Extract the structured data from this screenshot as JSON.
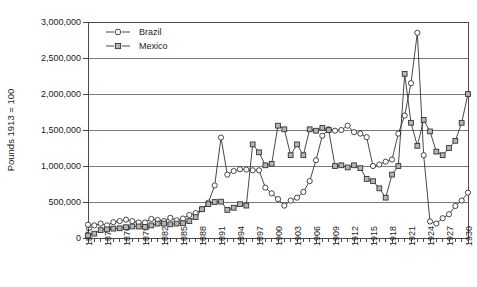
{
  "chart_data": {
    "type": "line",
    "title": "",
    "xlabel": "",
    "ylabel": "Pounds 1913 = 100",
    "xlim": [
      1870,
      1930
    ],
    "ylim": [
      0,
      3000000
    ],
    "ytick_labels": [
      "0",
      "500,000",
      "1,000,000",
      "1,500,000",
      "2,000,000",
      "2,500,000",
      "3,000,000"
    ],
    "ytick_values": [
      0,
      500000,
      1000000,
      1500000,
      2000000,
      2500000,
      3000000
    ],
    "xtick_labels": [
      "1870",
      "1873",
      "1876",
      "1879",
      "1882",
      "1885",
      "1888",
      "1891",
      "1894",
      "1897",
      "1900",
      "1903",
      "1906",
      "1909",
      "1912",
      "1915",
      "1918",
      "1921",
      "1924",
      "1927",
      "1930"
    ],
    "xtick_values": [
      1870,
      1873,
      1876,
      1879,
      1882,
      1885,
      1888,
      1891,
      1894,
      1897,
      1900,
      1903,
      1906,
      1909,
      1912,
      1915,
      1918,
      1921,
      1924,
      1927,
      1930
    ],
    "grid": true,
    "legend_position": "top-left",
    "x": [
      1870,
      1871,
      1872,
      1873,
      1874,
      1875,
      1876,
      1877,
      1878,
      1879,
      1880,
      1881,
      1882,
      1883,
      1884,
      1885,
      1886,
      1887,
      1888,
      1889,
      1890,
      1891,
      1892,
      1893,
      1894,
      1895,
      1896,
      1897,
      1898,
      1899,
      1900,
      1901,
      1902,
      1903,
      1904,
      1905,
      1906,
      1907,
      1908,
      1909,
      1910,
      1911,
      1912,
      1913,
      1914,
      1915,
      1916,
      1917,
      1918,
      1919,
      1920,
      1921,
      1922,
      1923,
      1924,
      1925,
      1926,
      1927,
      1928,
      1929,
      1930
    ],
    "series": [
      {
        "name": "Brazil",
        "marker": "circle",
        "values": [
          185000,
          175000,
          200000,
          175000,
          220000,
          235000,
          255000,
          235000,
          215000,
          215000,
          265000,
          250000,
          235000,
          280000,
          245000,
          270000,
          320000,
          345000,
          400000,
          490000,
          730000,
          1395000,
          880000,
          930000,
          955000,
          950000,
          940000,
          940000,
          700000,
          620000,
          540000,
          450000,
          520000,
          560000,
          640000,
          790000,
          1080000,
          1420000,
          1510000,
          1490000,
          1500000,
          1560000,
          1470000,
          1450000,
          1400000,
          1000000,
          1020000,
          1060000,
          1090000,
          1450000,
          1700000,
          2150000,
          2850000,
          1150000,
          230000,
          200000,
          275000,
          330000,
          445000,
          520000,
          630000
        ]
      },
      {
        "name": "Mexico",
        "marker": "square",
        "values": [
          35000,
          60000,
          110000,
          120000,
          130000,
          135000,
          150000,
          160000,
          160000,
          155000,
          175000,
          200000,
          200000,
          190000,
          200000,
          205000,
          235000,
          290000,
          400000,
          470000,
          500000,
          505000,
          390000,
          420000,
          470000,
          450000,
          1300000,
          1190000,
          1010000,
          1030000,
          1560000,
          1510000,
          1150000,
          1300000,
          1150000,
          1510000,
          1490000,
          1530000,
          1500000,
          1000000,
          1010000,
          980000,
          1010000,
          970000,
          820000,
          790000,
          690000,
          560000,
          880000,
          1000000,
          2280000,
          1600000,
          1280000,
          1640000,
          1480000,
          1200000,
          1150000,
          1250000,
          1350000,
          1600000,
          2000000
        ]
      }
    ]
  },
  "legend": {
    "items": [
      {
        "label": "Brazil",
        "marker": "circle"
      },
      {
        "label": "Mexico",
        "marker": "square"
      }
    ]
  }
}
